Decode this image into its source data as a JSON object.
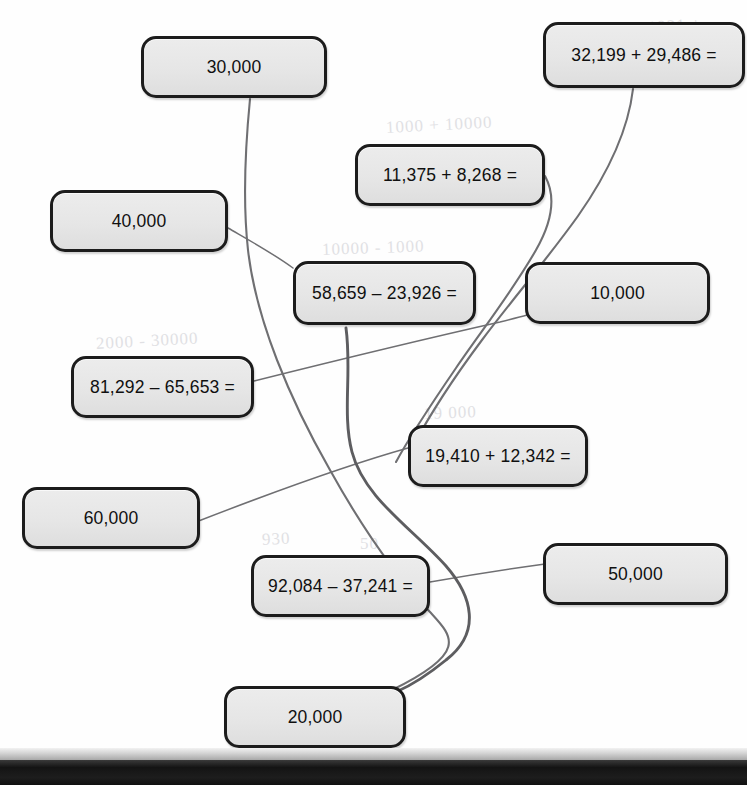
{
  "worksheet": {
    "type": "matching-exercise",
    "description": "Math matching worksheet: equations connected by hand-drawn lines to rounded answers",
    "equation_cards": [
      {
        "id": "eq-32199",
        "text": "32,199 + 29,486 =",
        "x": 543,
        "y": 22,
        "w": 202,
        "h": 66
      },
      {
        "id": "eq-11375",
        "text": "11,375 + 8,268 =",
        "x": 355,
        "y": 144,
        "w": 190,
        "h": 62
      },
      {
        "id": "eq-58659",
        "text": "58,659 – 23,926 =",
        "x": 293,
        "y": 261,
        "w": 183,
        "h": 64
      },
      {
        "id": "eq-81292",
        "text": "81,292 – 65,653 =",
        "x": 71,
        "y": 356,
        "w": 183,
        "h": 62
      },
      {
        "id": "eq-19410",
        "text": "19,410 + 12,342 =",
        "x": 408,
        "y": 425,
        "w": 180,
        "h": 62
      },
      {
        "id": "eq-92084",
        "text": "92,084 – 37,241 =",
        "x": 251,
        "y": 555,
        "w": 179,
        "h": 62
      }
    ],
    "answer_cards": [
      {
        "id": "ans-30000",
        "text": "30,000",
        "x": 141,
        "y": 36,
        "w": 186,
        "h": 62
      },
      {
        "id": "ans-40000",
        "text": "40,000",
        "x": 50,
        "y": 190,
        "w": 178,
        "h": 62
      },
      {
        "id": "ans-10000",
        "text": "10,000",
        "x": 525,
        "y": 262,
        "w": 185,
        "h": 62
      },
      {
        "id": "ans-60000",
        "text": "60,000",
        "x": 22,
        "y": 487,
        "w": 178,
        "h": 62
      },
      {
        "id": "ans-50000",
        "text": "50,000",
        "x": 543,
        "y": 543,
        "w": 185,
        "h": 62
      },
      {
        "id": "ans-20000",
        "text": "20,000",
        "x": 224,
        "y": 686,
        "w": 182,
        "h": 62
      }
    ],
    "connectors": [
      {
        "id": "link-30000",
        "from": "ans-30000",
        "weight": "med",
        "d": "M 250 99 C 246 140 242 196 248 250 C 256 320 290 400 330 470 C 360 524 392 572 430 612 C 452 636 470 652 392 690"
      },
      {
        "id": "link-40000",
        "from": "ans-40000",
        "to": "eq-58659",
        "weight": "thin",
        "d": "M 228 228 C 254 243 274 254 293 268"
      },
      {
        "id": "link-11375",
        "from": "eq-11375",
        "weight": "med",
        "d": "M 545 176 C 556 196 552 222 536 250 C 512 292 482 330 456 368 C 430 406 410 436 396 462"
      },
      {
        "id": "link-32199",
        "from": "eq-32199",
        "weight": "med",
        "d": "M 633 89 C 628 132 606 176 578 216 C 548 258 512 300 482 340 C 452 380 428 418 412 448"
      },
      {
        "id": "link-81292",
        "from": "eq-81292",
        "to": "ans-10000",
        "weight": "thin",
        "d": "M 254 381 C 330 362 420 340 500 322 C 512 319 520 317 527 315"
      },
      {
        "id": "link-60000",
        "from": "ans-60000",
        "to": "eq-19410",
        "weight": "thin",
        "d": "M 196 522 C 268 494 344 466 408 448"
      },
      {
        "id": "link-92084",
        "from": "eq-92084",
        "to": "ans-50000",
        "weight": "thin",
        "d": "M 430 582 C 476 574 516 568 545 564"
      },
      {
        "id": "link-20000",
        "from": "ans-20000",
        "weight": "thick",
        "d": "M 346 328 C 352 372 342 414 352 452 C 364 498 412 528 446 566 C 472 596 482 632 446 660 C 424 678 410 686 396 692"
      }
    ],
    "ghost_marks": [
      {
        "text": "1000 + 10000",
        "x": 386,
        "y": 118,
        "rot": -3
      },
      {
        "text": "1921 +",
        "x": 648,
        "y": 18,
        "rot": -4
      },
      {
        "text": "10000 - 1000",
        "x": 322,
        "y": 240,
        "rot": -2
      },
      {
        "text": "2000 - 30000",
        "x": 96,
        "y": 334,
        "rot": -3
      },
      {
        "text": "19 000",
        "x": 424,
        "y": 404,
        "rot": -2
      },
      {
        "text": "930",
        "x": 262,
        "y": 530,
        "rot": -3
      },
      {
        "text": "50",
        "x": 360,
        "y": 534,
        "rot": 0
      }
    ],
    "style": {
      "card_fill": "#e8e8e8",
      "card_border": "#1c1c1c",
      "line_color": "#6f6f72",
      "page_background": "#fefefe",
      "photo_edge_color": "#141414"
    }
  }
}
